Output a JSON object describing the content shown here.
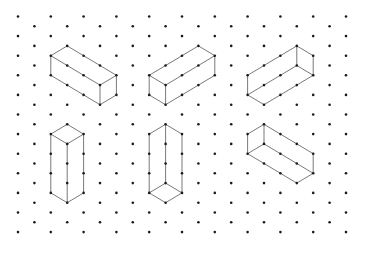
{
  "colors": {
    "background": "#ffffff",
    "dot": "#1a1a1a",
    "edge": "#6a6a6a"
  },
  "grid": {
    "columns": 21,
    "origin_x": 18,
    "col_spacing": 16.4,
    "origin_y": 16.5,
    "half_row_spacing": 9.8,
    "even_col_dots": 12,
    "odd_col_dots": 11
  },
  "shapes": [
    {
      "name": "prism-1",
      "edges": [
        [
          [
            2,
            4
          ],
          [
            3,
            3
          ]
        ],
        [
          [
            3,
            3
          ],
          [
            6,
            6
          ]
        ],
        [
          [
            2,
            4
          ],
          [
            5,
            7
          ]
        ],
        [
          [
            5,
            7
          ],
          [
            6,
            6
          ]
        ],
        [
          [
            2,
            4
          ],
          [
            2,
            6
          ]
        ],
        [
          [
            5,
            7
          ],
          [
            5,
            9
          ]
        ],
        [
          [
            6,
            6
          ],
          [
            6,
            8
          ]
        ],
        [
          [
            2,
            6
          ],
          [
            5,
            9
          ]
        ],
        [
          [
            5,
            9
          ],
          [
            6,
            8
          ]
        ]
      ]
    },
    {
      "name": "prism-2",
      "edges": [
        [
          [
            8,
            6
          ],
          [
            11,
            3
          ]
        ],
        [
          [
            11,
            3
          ],
          [
            12,
            4
          ]
        ],
        [
          [
            8,
            6
          ],
          [
            9,
            7
          ]
        ],
        [
          [
            9,
            7
          ],
          [
            12,
            4
          ]
        ],
        [
          [
            8,
            6
          ],
          [
            8,
            8
          ]
        ],
        [
          [
            9,
            7
          ],
          [
            9,
            9
          ]
        ],
        [
          [
            12,
            4
          ],
          [
            12,
            6
          ]
        ],
        [
          [
            8,
            8
          ],
          [
            9,
            9
          ]
        ],
        [
          [
            9,
            9
          ],
          [
            12,
            6
          ]
        ]
      ]
    },
    {
      "name": "prism-3",
      "edges": [
        [
          [
            14,
            6
          ],
          [
            17,
            3
          ]
        ],
        [
          [
            17,
            3
          ],
          [
            18,
            4
          ]
        ],
        [
          [
            18,
            4
          ],
          [
            18,
            6
          ]
        ],
        [
          [
            18,
            6
          ],
          [
            15,
            9
          ]
        ],
        [
          [
            15,
            9
          ],
          [
            14,
            8
          ]
        ],
        [
          [
            14,
            8
          ],
          [
            14,
            6
          ]
        ],
        [
          [
            14,
            8
          ],
          [
            17,
            5
          ]
        ],
        [
          [
            17,
            5
          ],
          [
            17,
            3
          ]
        ],
        [
          [
            17,
            5
          ],
          [
            18,
            6
          ]
        ]
      ]
    },
    {
      "name": "prism-4",
      "edges": [
        [
          [
            3,
            11
          ],
          [
            2,
            12
          ]
        ],
        [
          [
            3,
            11
          ],
          [
            4,
            12
          ]
        ],
        [
          [
            2,
            12
          ],
          [
            3,
            13
          ]
        ],
        [
          [
            4,
            12
          ],
          [
            3,
            13
          ]
        ],
        [
          [
            2,
            12
          ],
          [
            2,
            18
          ]
        ],
        [
          [
            3,
            13
          ],
          [
            3,
            19
          ]
        ],
        [
          [
            4,
            12
          ],
          [
            4,
            18
          ]
        ],
        [
          [
            2,
            18
          ],
          [
            3,
            19
          ]
        ],
        [
          [
            3,
            19
          ],
          [
            4,
            18
          ]
        ]
      ]
    },
    {
      "name": "prism-5",
      "edges": [
        [
          [
            9,
            11
          ],
          [
            8,
            12
          ]
        ],
        [
          [
            9,
            11
          ],
          [
            10,
            12
          ]
        ],
        [
          [
            8,
            12
          ],
          [
            8,
            18
          ]
        ],
        [
          [
            9,
            11
          ],
          [
            9,
            17
          ]
        ],
        [
          [
            10,
            12
          ],
          [
            10,
            18
          ]
        ],
        [
          [
            8,
            18
          ],
          [
            9,
            17
          ]
        ],
        [
          [
            9,
            17
          ],
          [
            10,
            18
          ]
        ],
        [
          [
            8,
            18
          ],
          [
            9,
            19
          ]
        ],
        [
          [
            9,
            19
          ],
          [
            10,
            18
          ]
        ]
      ]
    },
    {
      "name": "prism-6",
      "edges": [
        [
          [
            15,
            11
          ],
          [
            14,
            12
          ]
        ],
        [
          [
            14,
            12
          ],
          [
            14,
            14
          ]
        ],
        [
          [
            15,
            11
          ],
          [
            15,
            13
          ]
        ],
        [
          [
            15,
            11
          ],
          [
            18,
            14
          ]
        ],
        [
          [
            15,
            13
          ],
          [
            14,
            14
          ]
        ],
        [
          [
            15,
            13
          ],
          [
            18,
            16
          ]
        ],
        [
          [
            18,
            14
          ],
          [
            18,
            16
          ]
        ],
        [
          [
            14,
            14
          ],
          [
            17,
            17
          ]
        ],
        [
          [
            17,
            17
          ],
          [
            18,
            16
          ]
        ]
      ]
    }
  ]
}
